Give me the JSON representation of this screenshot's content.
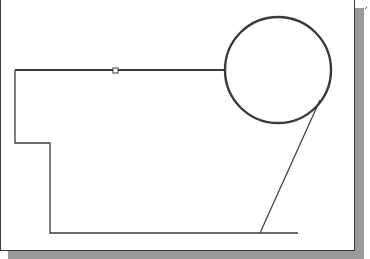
{
  "canvas": {
    "width": 370,
    "height": 259,
    "background": "#ffffff"
  },
  "colors": {
    "line": "#3a3a3a",
    "shadow": "#9a9a9a",
    "frame": "#3a3a3a"
  },
  "drawing": {
    "top_line": {
      "x1": 15,
      "y1": 70,
      "x2": 225,
      "y2": 70,
      "width": 2.2
    },
    "grip": {
      "x": 113,
      "y": 68,
      "size": 5
    },
    "circle": {
      "cx": 278,
      "cy": 70,
      "r": 53,
      "width": 2.4
    },
    "polyline": "15,70 15,143 50,143 50,233 298,233",
    "tangent_line": {
      "x1": 320,
      "y1": 100,
      "x2": 260,
      "y2": 233,
      "width": 1.2
    },
    "corner_mark": {
      "x1": 365,
      "y1": 9,
      "x2": 367,
      "y2": 7
    }
  }
}
